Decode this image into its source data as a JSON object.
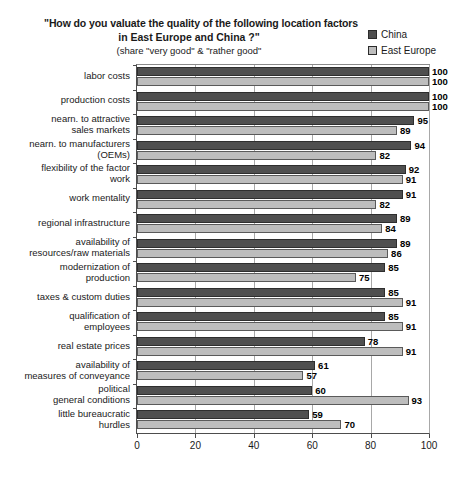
{
  "chart_data": {
    "type": "bar",
    "orientation": "horizontal",
    "title": "\"How do you valuate the quality of the following location factors in East Europe and China ?\" (share \"very good\" & \"rather good\"",
    "title_lines": [
      "\"How do you valuate the quality of the following location factors",
      "in East Europe and China ?\"",
      "(share \"very good\" & \"rather good\""
    ],
    "xlabel": "",
    "ylabel": "",
    "xlim": [
      0,
      100
    ],
    "xticks": [
      0,
      20,
      40,
      60,
      80,
      100
    ],
    "grid": true,
    "grid_axis": "x",
    "legend_position": "top-right",
    "categories": [
      "labor costs",
      "production costs",
      "nearn. to attractive\nsales markets",
      "nearn. to manufacturers\n(OEMs)",
      "flexibility of the factor\nwork",
      "work mentality",
      "regional infrastructure",
      "availability of\nresources/raw materials",
      "modernization of\nproduction",
      "taxes & custom duties",
      "qualification of\nemployees",
      "real estate prices",
      "availability of\nmeasures of conveyance",
      "political\ngeneral conditions",
      "little bureaucratic\nhurdles"
    ],
    "series": [
      {
        "name": "China",
        "color": "#4f4f4f",
        "values": [
          100,
          100,
          95,
          94,
          92,
          91,
          89,
          89,
          85,
          85,
          85,
          78,
          61,
          60,
          59
        ]
      },
      {
        "name": "East Europe",
        "color": "#bdbdbd",
        "values": [
          100,
          100,
          89,
          82,
          91,
          82,
          84,
          86,
          75,
          91,
          91,
          91,
          57,
          93,
          70
        ]
      }
    ]
  },
  "legend": {
    "items": [
      {
        "label": "China",
        "color": "#4f4f4f"
      },
      {
        "label": "East Europe",
        "color": "#bdbdbd"
      }
    ]
  }
}
